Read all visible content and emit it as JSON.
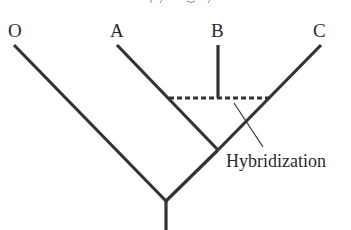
{
  "diagram": {
    "type": "phylogenetic-tree-with-hybridization",
    "taxa": [
      {
        "id": "O",
        "label": "O"
      },
      {
        "id": "A",
        "label": "A"
      },
      {
        "id": "B",
        "label": "B"
      },
      {
        "id": "C",
        "label": "C"
      }
    ],
    "annotation": {
      "label": "Hybridization",
      "points_to": "hybridization-dashed-edge"
    },
    "edges": [
      {
        "from": "root",
        "to": "node-OAC",
        "style": "solid"
      },
      {
        "from": "node-OAC",
        "to": "O",
        "style": "solid"
      },
      {
        "from": "node-OAC",
        "to": "node-AC",
        "style": "solid"
      },
      {
        "from": "node-AC",
        "to": "A",
        "style": "solid"
      },
      {
        "from": "node-AC",
        "to": "C",
        "style": "solid"
      },
      {
        "from": "A-branch",
        "to": "C-branch",
        "style": "dashed",
        "meaning": "hybridization"
      },
      {
        "from": "hybridization-edge",
        "to": "B",
        "style": "solid"
      }
    ],
    "colors": {
      "line": "#333333",
      "text": "#2b2b2b",
      "background": "#ffffff"
    }
  }
}
